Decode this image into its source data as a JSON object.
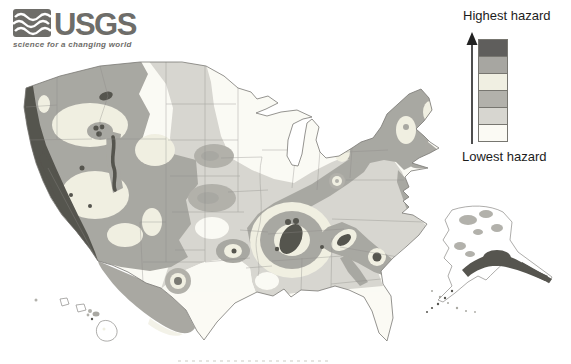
{
  "logo": {
    "org": "USGS",
    "tagline": "science for a changing world",
    "color": "#6e6d69",
    "icon": "usgs-wave-icon"
  },
  "legend": {
    "highest_label": "Highest hazard",
    "lowest_label": "Lowest hazard",
    "arrow_icon": "up-arrow-icon",
    "swatches": [
      {
        "name": "hazard-level-6-highest",
        "color": "#5f5e5c"
      },
      {
        "name": "hazard-level-5",
        "color": "#a7a6a1"
      },
      {
        "name": "hazard-level-4",
        "color": "#f0efe2"
      },
      {
        "name": "hazard-level-3",
        "color": "#b2b1ab"
      },
      {
        "name": "hazard-level-2",
        "color": "#d7d6d0"
      },
      {
        "name": "hazard-level-1-lowest",
        "color": "#fbfaf4"
      }
    ]
  },
  "map": {
    "insets": [
      "conterminous-us",
      "alaska",
      "hawaii"
    ],
    "palette": {
      "highest": "#56554f",
      "high": "#a9a8a2",
      "moderate_cream": "#f0efe2",
      "moderate_gray": "#b2b1ab",
      "low": "#d7d6d0",
      "lowest": "#fbfaf4",
      "coast_outline": "#7a7975",
      "state_line": "#8b8a86"
    }
  }
}
